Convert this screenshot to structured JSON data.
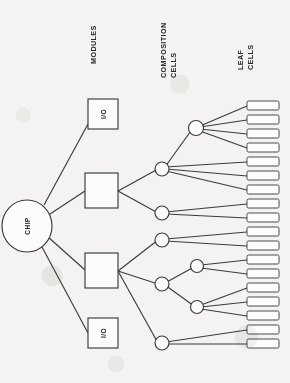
{
  "figure": {
    "type": "hierarchical-tree-diagram",
    "orientation": "rotated-90-clockwise",
    "background_color": "#f4f3f1",
    "line_color": "#3b3b3b",
    "column_labels": [
      {
        "id": "modules",
        "text": "MODULES",
        "lines": [
          "MODULES"
        ]
      },
      {
        "id": "composition-cells",
        "text": "COMPOSITION CELLS",
        "lines": [
          "COMPOSITION",
          "CELLS"
        ]
      },
      {
        "id": "leaf-cells",
        "text": "LEAF CELLS",
        "lines": [
          "LEAF",
          "CELLS"
        ]
      }
    ],
    "root": {
      "id": "chip",
      "label": "CHIP",
      "shape": "ellipse"
    },
    "modules": [
      {
        "id": "io-top",
        "label": "I/O",
        "shape": "square"
      },
      {
        "id": "module-1",
        "label": "",
        "shape": "square"
      },
      {
        "id": "module-2",
        "label": "",
        "shape": "square"
      },
      {
        "id": "io-bottom",
        "label": "I/O",
        "shape": "square"
      }
    ],
    "composition_cells": [
      {
        "id": "cc-1",
        "label": "",
        "shape": "circle",
        "parent": "module-1",
        "leaf_count": 4
      },
      {
        "id": "cc-2",
        "label": "",
        "shape": "circle",
        "parent": "cc-1",
        "leaf_count": 3
      },
      {
        "id": "cc-3",
        "label": "",
        "shape": "circle",
        "parent": "module-1",
        "leaf_count": 2
      },
      {
        "id": "cc-4",
        "label": "",
        "shape": "circle",
        "parent": "module-2",
        "leaf_count": 2
      },
      {
        "id": "cc-5",
        "label": "",
        "shape": "circle",
        "parent": "module-2",
        "leaf_count": 2
      },
      {
        "id": "cc-6",
        "label": "",
        "shape": "circle",
        "parent": "cc-5",
        "leaf_count": 2
      },
      {
        "id": "cc-7",
        "label": "",
        "shape": "circle",
        "parent": "cc-5",
        "leaf_count": 3
      },
      {
        "id": "cc-8",
        "label": "",
        "shape": "circle",
        "parent": "module-2",
        "leaf_count": 2
      }
    ],
    "leaf_cells": {
      "count": 20,
      "label": "",
      "shape": "rounded-rectangle"
    }
  }
}
